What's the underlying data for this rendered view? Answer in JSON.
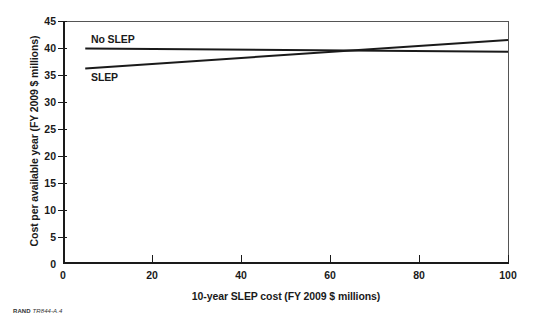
{
  "figure": {
    "footer_brand": "RAND",
    "footer_number": "TR844-A.4"
  },
  "chart_data": {
    "type": "line",
    "title": "",
    "xlabel": "10-year SLEP cost (FY 2009 $ millions)",
    "ylabel": "Cost per available year (FY 2009 $ millions)",
    "xlim": [
      0,
      100
    ],
    "ylim": [
      0,
      45
    ],
    "xticks": [
      0,
      20,
      40,
      60,
      80,
      100
    ],
    "yticks": [
      0,
      5,
      10,
      15,
      20,
      25,
      30,
      35,
      40,
      45
    ],
    "grid": false,
    "legend": "inline-labels",
    "line_color": "#1a1a1a",
    "series": [
      {
        "name": "No SLEP",
        "label_text": "No SLEP",
        "x": [
          5,
          100
        ],
        "values": [
          39.9,
          39.3
        ]
      },
      {
        "name": "SLEP",
        "label_text": "SLEP",
        "x": [
          5,
          100
        ],
        "values": [
          36.2,
          41.5
        ]
      }
    ],
    "annotations": [
      "Lines cross at approximately x = 64, y = 39.6"
    ]
  }
}
